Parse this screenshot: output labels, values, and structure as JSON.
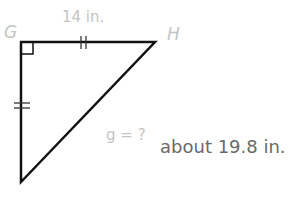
{
  "figure": {
    "type": "right-isosceles-triangle",
    "vertices": {
      "G": {
        "label": "G",
        "x": 21,
        "y": 42
      },
      "H": {
        "label": "H",
        "x": 155,
        "y": 42
      },
      "F": {
        "label": "",
        "x": 21,
        "y": 182
      }
    },
    "labels": {
      "vertex_g": "G",
      "vertex_h": "H",
      "side_gh": "14 in.",
      "hypotenuse": "g = ?",
      "answer": "about 19.8 in."
    },
    "colors": {
      "stroke": "#000000",
      "faint_text": "#c4c4c4",
      "answer_text": "#6a6a6a"
    }
  }
}
